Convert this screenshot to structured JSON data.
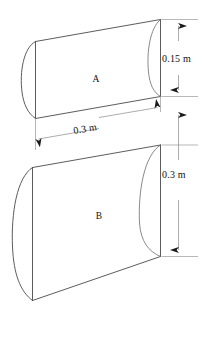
{
  "figure": {
    "background_color": "#ffffff",
    "line_color": "#4a4a4a",
    "dimension_line_color": "#8a8a8a",
    "text_color": "#111111",
    "parts": [
      {
        "id": "A",
        "label": "A",
        "description": "upper curved plate segment"
      },
      {
        "id": "B",
        "label": "B",
        "description": "lower curved plate segment"
      }
    ],
    "dimensions": [
      {
        "id": "height-a",
        "label": "0.15 m",
        "orientation": "vertical",
        "applies_to": "A",
        "arrow_style": "double-headed"
      },
      {
        "id": "width-shared",
        "label": "0.3 m",
        "orientation": "slanted",
        "applies_to": "A and B width",
        "arrow_style": "double-headed"
      },
      {
        "id": "height-b",
        "label": "0.3 m",
        "orientation": "vertical",
        "applies_to": "B",
        "arrow_style": "double-headed"
      }
    ]
  }
}
